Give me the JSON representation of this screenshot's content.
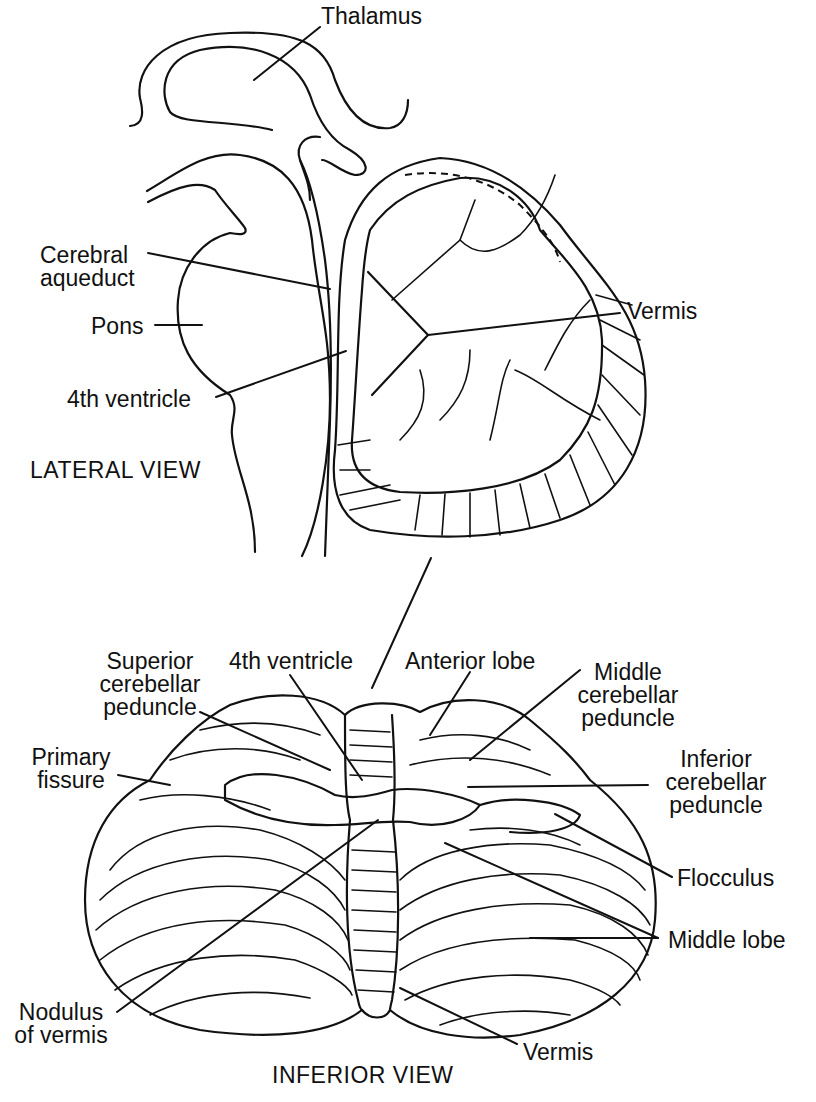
{
  "figure": {
    "lateral_view": {
      "caption": "LATERAL VIEW",
      "labels": {
        "thalamus": "Thalamus",
        "cerebral_aqueduct_1": "Cerebral",
        "cerebral_aqueduct_2": "aqueduct",
        "vermis": "Vermis",
        "pons": "Pons",
        "fourth_ventricle": "4th ventricle"
      }
    },
    "inferior_view": {
      "caption": "INFERIOR VIEW",
      "labels": {
        "superior_cp_1": "Superior",
        "superior_cp_2": "cerebellar",
        "superior_cp_3": "peduncle",
        "fourth_ventricle": "4th ventricle",
        "anterior_lobe": "Anterior lobe",
        "middle_cp_1": "Middle",
        "middle_cp_2": "cerebellar",
        "middle_cp_3": "peduncle",
        "primary_fissure_1": "Primary",
        "primary_fissure_2": "fissure",
        "inferior_cp_1": "Inferior",
        "inferior_cp_2": "cerebellar",
        "inferior_cp_3": "peduncle",
        "flocculus": "Flocculus",
        "middle_lobe": "Middle lobe",
        "nodulus_1": "Nodulus",
        "nodulus_2": "of vermis",
        "vermis": "Vermis"
      }
    }
  }
}
